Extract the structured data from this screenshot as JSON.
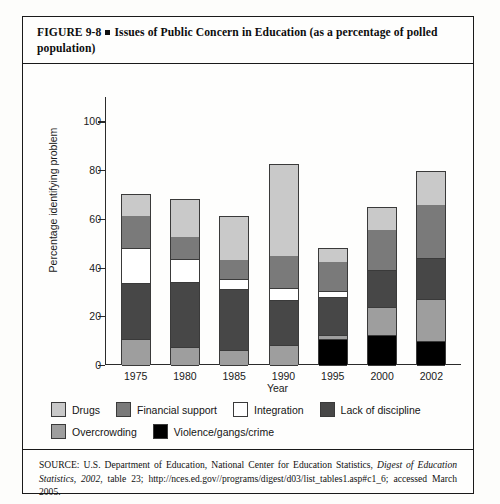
{
  "figure": {
    "label": "FIGURE 9-8",
    "title": "Issues of Public Concern in Education (as a percentage of polled population)"
  },
  "source": {
    "prefix": "SOURCE: U.S. Department of Education, National Center for Education Statistics, ",
    "italic": "Digest of Education Statistics, 2002",
    "suffix": ", table 23; http://nces.ed.gov//programs/digest/d03/list_tables1.asp#c1_6; accessed March 2005."
  },
  "chart_data": {
    "type": "bar",
    "stacked": true,
    "title": "Issues of Public Concern in Education (as a percentage of polled population)",
    "xlabel": "Year",
    "ylabel": "Percentage identifying problem",
    "categories": [
      "1975",
      "1980",
      "1985",
      "1990",
      "1995",
      "2000",
      "2002"
    ],
    "ylim": [
      0,
      110
    ],
    "yticks": [
      0,
      20,
      40,
      60,
      80,
      100
    ],
    "grid": false,
    "legend_position": "bottom",
    "colors": {
      "drugs": "#c9c9c9",
      "financial_support": "#7a7a7a",
      "integration": "#ffffff",
      "lack_of_discipline": "#474747",
      "overcrowding": "#9e9e9e",
      "violence": "#000000"
    },
    "series": [
      {
        "name": "Violence/gangs/crime",
        "key": "violence",
        "values": [
          0,
          0,
          0,
          0,
          10.5,
          12.5,
          10.0
        ]
      },
      {
        "name": "Overcrowding",
        "key": "overcrowding",
        "values": [
          10.5,
          7.5,
          6.0,
          8.0,
          2.0,
          11.5,
          17.0
        ]
      },
      {
        "name": "Lack of discipline",
        "key": "lack_of_discipline",
        "values": [
          23.0,
          26.5,
          25.0,
          18.5,
          15.5,
          15.0,
          17.0
        ]
      },
      {
        "name": "Integration",
        "key": "integration",
        "values": [
          14.5,
          9.5,
          4.5,
          5.0,
          2.5,
          0,
          0
        ]
      },
      {
        "name": "Financial support",
        "key": "financial_support",
        "values": [
          13.5,
          9.5,
          8.0,
          13.5,
          12.0,
          17.0,
          22.0
        ]
      },
      {
        "name": "Drugs",
        "key": "drugs",
        "values": [
          8.5,
          15.0,
          17.5,
          37.5,
          5.5,
          9.0,
          13.5
        ]
      }
    ],
    "totals": [
      70.0,
      68.0,
      61.0,
      82.5,
      47.5,
      65.0,
      79.5
    ],
    "legend": [
      {
        "label": "Drugs",
        "color": "#c9c9c9"
      },
      {
        "label": "Financial support",
        "color": "#7a7a7a"
      },
      {
        "label": "Integration",
        "color": "#ffffff"
      },
      {
        "label": "Lack of discipline",
        "color": "#474747"
      },
      {
        "label": "Overcrowding",
        "color": "#9e9e9e"
      },
      {
        "label": "Violence/gangs/crime",
        "color": "#000000"
      }
    ]
  }
}
